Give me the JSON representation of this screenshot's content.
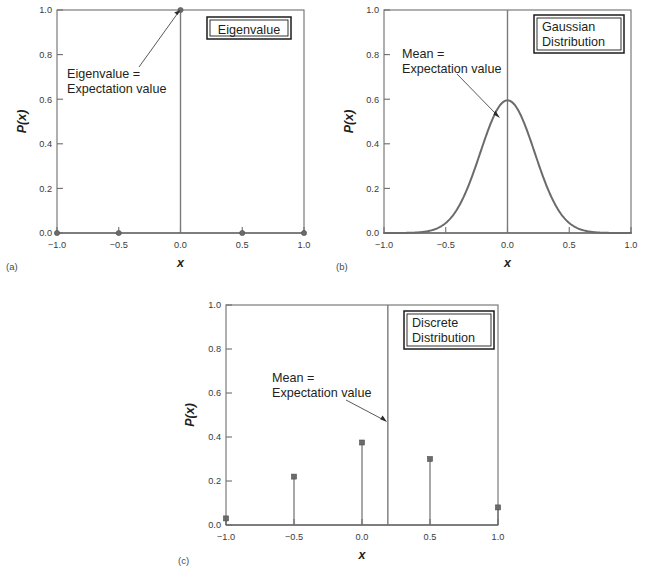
{
  "figure": {
    "background": "#ffffff",
    "line_color": "#6b6b6b",
    "text_color": "#231f20",
    "panels": [
      {
        "letter": "(a)",
        "box_label_lines": [
          "Eigenvalue"
        ],
        "annotation_lines": [
          "Eigenvalue =",
          "Expectation value"
        ]
      },
      {
        "letter": "(b)",
        "box_label_lines": [
          "Gaussian",
          "Distribution"
        ],
        "annotation_lines": [
          "Mean =",
          "Expectation value"
        ]
      },
      {
        "letter": "(c)",
        "box_label_lines": [
          "Discrete",
          "Distribution"
        ],
        "annotation_lines": [
          "Mean =",
          "Expectation value"
        ]
      }
    ]
  },
  "axes": {
    "xlabel": "x",
    "ylabel": "P(x)",
    "xticks": [
      "−1.0",
      "−0.5",
      "0.0",
      "0.5",
      "1.0"
    ],
    "xtick_values": [
      -1.0,
      -0.5,
      0.0,
      0.5,
      1.0
    ],
    "yticks": [
      "0.0",
      "0.2",
      "0.4",
      "0.6",
      "0.8",
      "1.0"
    ],
    "ytick_values": [
      0.0,
      0.2,
      0.4,
      0.6,
      0.8,
      1.0
    ],
    "xlim": [
      -1.0,
      1.0
    ],
    "ylim": [
      0.0,
      1.0
    ]
  },
  "chart_data": [
    {
      "id": "panel-a",
      "type": "scatter",
      "title": "Eigenvalue",
      "xlabel": "x",
      "ylabel": "P(x)",
      "xlim": [
        -1.0,
        1.0
      ],
      "ylim": [
        0.0,
        1.0
      ],
      "grid": false,
      "legend": "none",
      "x": [
        -1.0,
        -0.5,
        0.0,
        0.5,
        1.0
      ],
      "values": [
        0.0,
        0.0,
        1.0,
        0.0,
        0.0
      ],
      "xticks": [
        "−1.0",
        "−0.5",
        "0.0",
        "0.5",
        "1.0"
      ],
      "yticks": [
        "0.0",
        "0.2",
        "0.4",
        "0.6",
        "0.8",
        "1.0"
      ],
      "mean_line_x": 0.0,
      "annotation": {
        "lines": [
          "Eigenvalue =",
          "Expectation value"
        ],
        "points_to_x": 0.0,
        "points_to_y": 1.0
      }
    },
    {
      "id": "panel-b",
      "type": "line",
      "title": "Gaussian Distribution",
      "xlabel": "x",
      "ylabel": "P(x)",
      "xlim": [
        -1.0,
        1.0
      ],
      "ylim": [
        0.0,
        1.0
      ],
      "grid": false,
      "legend": "none",
      "xticks": [
        "−1.0",
        "−0.5",
        "0.0",
        "0.5",
        "1.0"
      ],
      "yticks": [
        "0.0",
        "0.2",
        "0.4",
        "0.6",
        "0.8",
        "1.0"
      ],
      "gaussian": {
        "mean": 0.0,
        "sigma": 0.22,
        "peak": 0.595
      },
      "mean_line_x": 0.0,
      "annotation": {
        "lines": [
          "Mean =",
          "Expectation value"
        ],
        "points_to_x": -0.06,
        "points_to_y": 0.52
      }
    },
    {
      "id": "panel-c",
      "type": "bar",
      "title": "Discrete Distribution",
      "xlabel": "x",
      "ylabel": "P(x)",
      "xlim": [
        -1.0,
        1.0
      ],
      "ylim": [
        0.0,
        1.0
      ],
      "grid": false,
      "legend": "none",
      "categories": [
        "−1.0",
        "−0.5",
        "0.0",
        "0.5",
        "1.0"
      ],
      "x": [
        -1.0,
        -0.5,
        0.0,
        0.5,
        1.0
      ],
      "values": [
        0.03,
        0.22,
        0.375,
        0.3,
        0.08
      ],
      "xticks": [
        "−1.0",
        "−0.5",
        "0.0",
        "0.5",
        "1.0"
      ],
      "yticks": [
        "0.0",
        "0.2",
        "0.4",
        "0.6",
        "0.8",
        "1.0"
      ],
      "mean_line_x": 0.19,
      "annotation": {
        "lines": [
          "Mean =",
          "Expectation value"
        ],
        "points_to_x": 0.19,
        "points_to_y": 0.5
      }
    }
  ]
}
